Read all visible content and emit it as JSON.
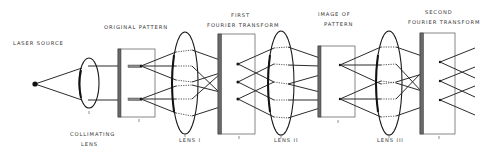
{
  "diagram": {
    "labels": {
      "laser_source": "LASER SOURCE",
      "original_pattern": "ORIGINAL PATTERN",
      "collimating_lens_line1": "COLLIMATING",
      "collimating_lens_line2": "LENS",
      "first_ft_line1": "FIRST",
      "first_ft_line2": "FOURIER TRANSFORM",
      "lens_1": "LENS I",
      "lens_2": "LENS II",
      "image_of_pattern_line1": "IMAGE OF",
      "image_of_pattern_line2": "PATTERN",
      "lens_3": "LENS III",
      "second_ft_line1": "SECOND",
      "second_ft_line2": "FOURIER TRANSFORM"
    },
    "components": [
      {
        "id": "laser-source",
        "type": "point source"
      },
      {
        "id": "collimating-lens",
        "type": "lens"
      },
      {
        "id": "original-pattern",
        "type": "plate",
        "apertures": 2
      },
      {
        "id": "lens-1",
        "type": "lens"
      },
      {
        "id": "first-fourier-transform",
        "type": "plate",
        "points": 3
      },
      {
        "id": "lens-2",
        "type": "lens"
      },
      {
        "id": "image-of-pattern",
        "type": "plate",
        "points": 2
      },
      {
        "id": "lens-3",
        "type": "lens"
      },
      {
        "id": "second-fourier-transform",
        "type": "plate",
        "points": 3
      }
    ],
    "colors": {
      "ink": "#2b2b2b",
      "plate_edge": "#6a6a6a",
      "background": "#ffffff"
    }
  }
}
